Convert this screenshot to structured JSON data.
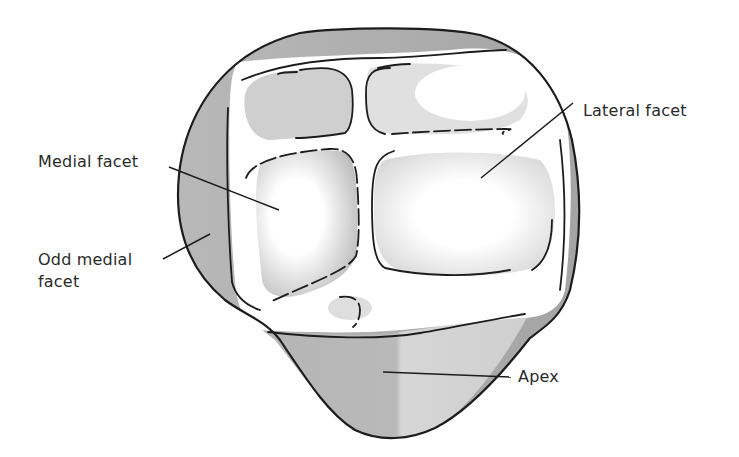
{
  "figure": {
    "labels": {
      "lateral_facet": "Lateral facet",
      "medial_facet": "Medial facet",
      "odd_medial_facet_line1": "Odd medial",
      "odd_medial_facet_line2": "facet",
      "apex": "Apex"
    }
  },
  "colors": {
    "stroke": "#1c1c1c",
    "shade_dark": "#a9a9a9",
    "shade_mid": "#c4c4c4",
    "shade_light": "#dcdcdc",
    "background": "#ffffff",
    "text": "#2a2a2a"
  }
}
